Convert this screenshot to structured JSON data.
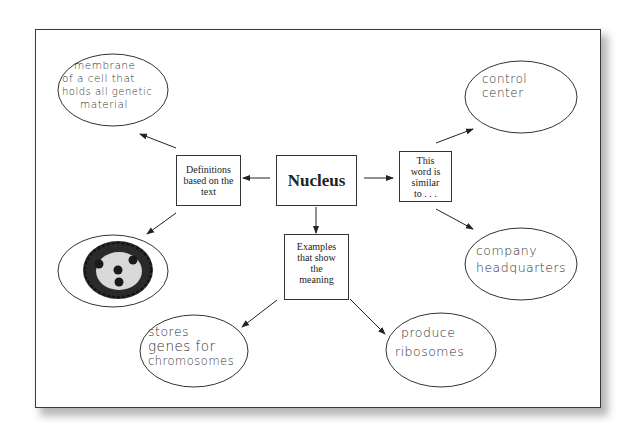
{
  "diagram": {
    "type": "concept-map",
    "center": {
      "label": "Nucleus"
    },
    "categories": [
      {
        "id": "definitions",
        "label": "Definitions based on the text"
      },
      {
        "id": "similar",
        "label": "This word is similar to . . ."
      },
      {
        "id": "examples",
        "label": "Examples that show the meaning"
      }
    ],
    "answers": {
      "definition_text": "membrane of a cell that holds all genetic material",
      "definition_drawing": "drawing of a cell nucleus with dark outline and four dots",
      "similar_1": "control center",
      "similar_2": "company headquarters",
      "example_1": "stores genes for chromosomes",
      "example_2": "produce ribosomes"
    },
    "handwritten_display": {
      "definition_text": [
        "membrane",
        "of a cell that",
        "holds all genetic",
        "material"
      ],
      "similar_1": [
        "control",
        "center"
      ],
      "similar_2": [
        "company",
        "headquarters"
      ],
      "example_1": [
        "stores",
        "genes for",
        "chromosomes"
      ],
      "example_2": [
        "produce",
        "ribosomes"
      ]
    },
    "definitions_lines": [
      "Definitions",
      "based on the",
      "text"
    ],
    "similar_lines": [
      "This",
      "word is",
      "similar",
      "to . . ."
    ],
    "examples_lines": [
      "Examples",
      "that show",
      "the",
      "meaning"
    ]
  }
}
